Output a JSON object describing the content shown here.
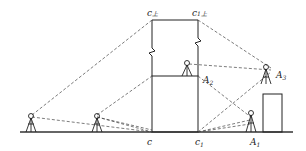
{
  "diagram": {
    "type": "surveying-elevation-transfer",
    "labels": {
      "c": "c",
      "c1": "c",
      "c1_sub": "1",
      "c_top": "c",
      "c_top_sub": "上",
      "c1_top": "c",
      "c1_top_sub": "1上",
      "A1": "A",
      "A1_sub": "1",
      "A2": "A",
      "A2_sub": "2",
      "A3": "A",
      "A3_sub": "3"
    },
    "elements": [
      "ground-line",
      "central-building",
      "tall-column-with-break-marks",
      "right-short-building",
      "instrument-far-left",
      "instrument-left",
      "instrument-A2-on-roof",
      "instrument-A1-ground",
      "instrument-A3-on-right-building",
      "dashed-sight-lines"
    ],
    "colors": {
      "line": "#222222",
      "background": "#ffffff"
    }
  }
}
